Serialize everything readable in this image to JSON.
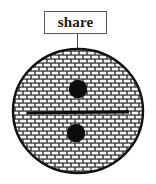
{
  "diagram": {
    "title_label": "share",
    "callout": {
      "text": "share",
      "box": {
        "x": 44,
        "y": 11,
        "width": 63,
        "height": 23
      },
      "border_color": "#59595b",
      "fill_color": "#ffffff",
      "text_color": "#1a1a1a"
    },
    "leader_line": {
      "from_x": 77,
      "from_y": 34,
      "to_x": 77,
      "to_y": 50,
      "color": "#4a4a4c"
    },
    "shape": {
      "name": "ellipse",
      "center_x": 78,
      "center_y": 111,
      "radius_x": 66,
      "radius_y": 63,
      "outline_color": "#111111",
      "outline_width": 2,
      "fill_pattern": "brick-hatch",
      "pattern_colors": {
        "mortar": "#1b1b1b",
        "brick": "#f2f2f2"
      },
      "pattern_cell": {
        "width": 8,
        "height": 4
      }
    },
    "symbol": {
      "name": "division-sign",
      "glyph": "÷",
      "color": "#0d0d0d",
      "bar": {
        "x1": 27,
        "x2": 129,
        "y": 111,
        "thickness": 4
      },
      "dots": [
        {
          "label": "top-dot",
          "cx": 78,
          "cy": 89,
          "r": 9
        },
        {
          "label": "bottom-dot",
          "cx": 76,
          "cy": 133,
          "r": 9
        }
      ]
    }
  }
}
